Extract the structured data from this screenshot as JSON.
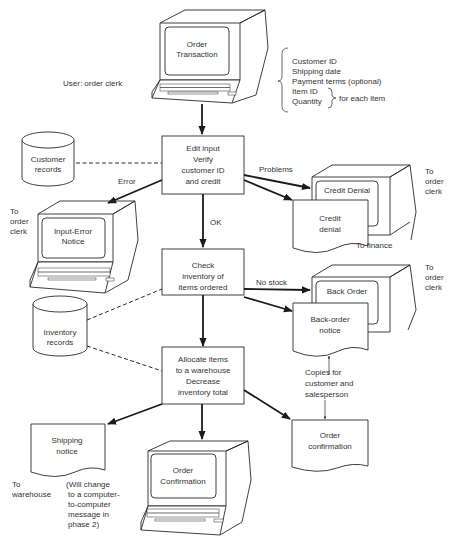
{
  "title_terminal": {
    "line1": "Order",
    "line2": "Transaction"
  },
  "user_label": "User:  order clerk",
  "input_fields": {
    "items": [
      "Customer ID",
      "Shipping date",
      "Payment terms (optional)",
      "Item ID",
      "Quantity"
    ],
    "for_each_item": "for each item"
  },
  "customer_records": {
    "line1": "Customer",
    "line2": "records"
  },
  "inventory_records": {
    "line1": "Inventory",
    "line2": "records"
  },
  "process_edit": {
    "line1": "Edit input",
    "line2": "Verify",
    "line3": "customer ID",
    "line4": "and credit"
  },
  "process_check": {
    "line1": "Check",
    "line2": "inventory of",
    "line3": "items ordered"
  },
  "process_allocate": {
    "line1": "Allocate items",
    "line2": "to a warehouse",
    "line3": "Decrease",
    "line4": "inventory total"
  },
  "labels": {
    "error": "Error",
    "ok": "OK",
    "problems": "Problems",
    "no_stock": "No stock"
  },
  "input_error_terminal": {
    "line1": "Input-Error",
    "line2": "Notice",
    "dest": [
      "To",
      "order",
      "clerk"
    ]
  },
  "credit_denial_terminal": {
    "screen": "Credit Denial",
    "dest": [
      "To",
      "order",
      "clerk"
    ]
  },
  "credit_denial_doc": {
    "line1": "Credit",
    "line2": "denial",
    "dest": "To finance"
  },
  "back_order_terminal": {
    "screen": "Back Order",
    "dest": [
      "To",
      "order",
      "clerk"
    ]
  },
  "back_order_doc": {
    "line1": "Back-order",
    "line2": "notice"
  },
  "copies_note": [
    "Copies for",
    "customer and",
    "salesperson"
  ],
  "shipping_doc": {
    "line1": "Shipping",
    "line2": "notice",
    "dest": [
      "To",
      "warehouse"
    ]
  },
  "phase_note": [
    "(Will change",
    "to a computer-",
    "to-computer",
    "message in",
    "phase 2)"
  ],
  "order_confirmation_terminal": {
    "line1": "Order",
    "line2": "Confirmation"
  },
  "order_confirmation_doc": {
    "line1": "Order",
    "line2": "confirmation"
  }
}
